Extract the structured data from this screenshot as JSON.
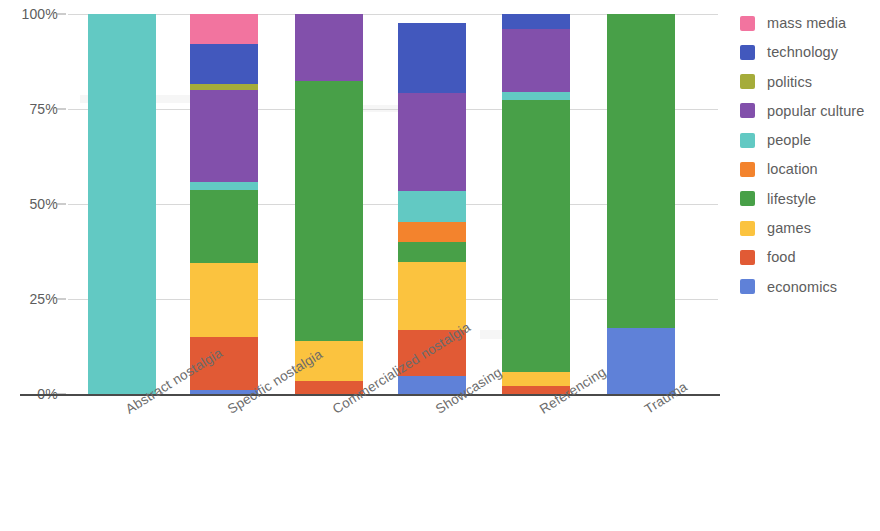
{
  "chart_data": {
    "type": "bar",
    "subtype": "stacked-percentage",
    "title": "",
    "xlabel": "",
    "ylabel": "",
    "ylim": [
      0,
      100
    ],
    "ytick_labels": [
      "0%",
      "25%",
      "50%",
      "75%",
      "100%"
    ],
    "ytick_values": [
      0,
      25,
      50,
      75,
      100
    ],
    "grid": true,
    "legend_position": "right",
    "categories": [
      "Abstract nostalgia",
      "Specific nostalgia",
      "Commercialized nostalgia",
      "Showcasing",
      "Referencing",
      "Trauma"
    ],
    "series": [
      {
        "name": "mass media",
        "color": "#f2749f",
        "values": [
          0,
          8.0,
          0,
          0,
          0,
          0
        ]
      },
      {
        "name": "technology",
        "color": "#4258bd",
        "values": [
          0,
          10.5,
          0,
          18.5,
          4.0,
          0
        ]
      },
      {
        "name": "politics",
        "color": "#a5ac3a",
        "values": [
          0,
          1.5,
          0,
          0,
          0,
          0
        ]
      },
      {
        "name": "popular culture",
        "color": "#8250ab",
        "values": [
          0,
          24.2,
          17.5,
          25.7,
          16.5,
          0
        ]
      },
      {
        "name": "people",
        "color": "#62c9c3",
        "values": [
          100,
          2.1,
          0,
          8.2,
          2.0,
          0
        ]
      },
      {
        "name": "location",
        "color": "#f3832d",
        "values": [
          0,
          0,
          0,
          5.2,
          0,
          0
        ]
      },
      {
        "name": "lifestyle",
        "color": "#48a048",
        "values": [
          0,
          19.2,
          68.5,
          5.4,
          71.7,
          82.5
        ]
      },
      {
        "name": "games",
        "color": "#fbc33f",
        "values": [
          0,
          19.5,
          10.5,
          17.9,
          3.7,
          0
        ]
      },
      {
        "name": "food",
        "color": "#e15a35",
        "values": [
          0,
          14.0,
          3.5,
          12.1,
          2.1,
          0
        ]
      },
      {
        "name": "economics",
        "color": "#5f81d8",
        "values": [
          0,
          1.0,
          0,
          4.7,
          0,
          17.5
        ]
      }
    ]
  },
  "legend": {
    "items": [
      {
        "label": "mass media",
        "icon": "color-swatch-icon"
      },
      {
        "label": "technology",
        "icon": "color-swatch-icon"
      },
      {
        "label": "politics",
        "icon": "color-swatch-icon"
      },
      {
        "label": "popular culture",
        "icon": "color-swatch-icon"
      },
      {
        "label": "people",
        "icon": "color-swatch-icon"
      },
      {
        "label": "location",
        "icon": "color-swatch-icon"
      },
      {
        "label": "lifestyle",
        "icon": "color-swatch-icon"
      },
      {
        "label": "games",
        "icon": "color-swatch-icon"
      },
      {
        "label": "food",
        "icon": "color-swatch-icon"
      },
      {
        "label": "economics",
        "icon": "color-swatch-icon"
      }
    ]
  }
}
